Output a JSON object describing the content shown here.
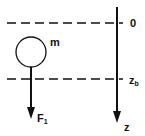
{
  "diagram": {
    "labels": {
      "origin": "0",
      "buoyancy_depth_main": "z",
      "buoyancy_depth_sub": "b",
      "axis": "z",
      "mass": "m",
      "force_main": "F",
      "force_sub": "1"
    },
    "elements": {
      "reference_lines": [
        "z = 0",
        "z = z_b"
      ],
      "axis_direction": "downward",
      "body": "sphere",
      "force_direction": "downward"
    },
    "colors": {
      "stroke": "#111111",
      "background": "#ffffff"
    }
  }
}
